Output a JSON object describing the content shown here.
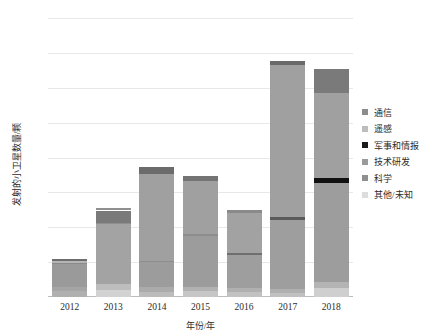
{
  "chart_data": {
    "type": "bar",
    "title": "",
    "subtitle": "",
    "stacked": true,
    "xlabel": "年份/年",
    "ylabel": "发射的小卫星数量/颗",
    "categories": [
      "2012",
      "2013",
      "2014",
      "2015",
      "2016",
      "2017",
      "2018"
    ],
    "ylim": [
      0,
      400
    ],
    "yticks": [
      0,
      50,
      100,
      150,
      200,
      250,
      300,
      350,
      400
    ],
    "ytick_labels": [
      "0",
      "50",
      "100",
      "150",
      "200",
      "250",
      "300",
      "350",
      "400"
    ],
    "grid": true,
    "legend_position": "right",
    "series": [
      {
        "name": "通信",
        "color": "#8c8c8c",
        "values": [
          8,
          6,
          10,
          9,
          5,
          102,
          12
        ]
      },
      {
        "name": "遥感",
        "color": "#bfbfbf",
        "values": [
          10,
          82,
          78,
          72,
          55,
          10,
          148
        ]
      },
      {
        "name": "军事和情报",
        "color": "#1a1a1a",
        "values": [
          2,
          2,
          2,
          2,
          2,
          2,
          6
        ]
      },
      {
        "name": "技术研发",
        "color": "#9a9a9a",
        "values": [
          25,
          28,
          82,
          76,
          56,
          205,
          124
        ]
      },
      {
        "name": "科学",
        "color": "#7d7d7d",
        "values": [
          8,
          7,
          12,
          13,
          5,
          17,
          35
        ]
      },
      {
        "name": "其他/未知",
        "color": "#d9d9d9",
        "values": [
          2,
          2,
          2,
          2,
          2,
          2,
          2
        ]
      }
    ],
    "totals": [
      55,
      127,
      186,
      174,
      125,
      338,
      327
    ],
    "series_colors": [
      "#8c8c8c",
      "#bfbfbf",
      "#1a1a1a",
      "#9a9a9a",
      "#7d7d7d",
      "#d9d9d9"
    ],
    "bar_stacks": [
      {
        "year": "2012",
        "total": 55,
        "segments": [
          {
            "name": "其他/未知",
            "from": 0,
            "to": 8,
            "color": "#b0b0b0"
          },
          {
            "name": "科学",
            "from": 8,
            "to": 14,
            "color": "#a5a5a5"
          },
          {
            "name": "技术研发",
            "from": 14,
            "to": 47,
            "color": "#9a9a9a"
          },
          {
            "name": "军事和情报",
            "from": 47,
            "to": 49,
            "color": "#8a8a8a"
          },
          {
            "name": "遥感",
            "from": 49,
            "to": 51,
            "color": "#b5b5b5"
          },
          {
            "name": "通信",
            "from": 51,
            "to": 55,
            "color": "#6e6e6e"
          }
        ]
      },
      {
        "year": "2013",
        "total": 127,
        "segments": [
          {
            "name": "其他/未知",
            "from": 0,
            "to": 10,
            "color": "#d2d2d2"
          },
          {
            "name": "科学",
            "from": 10,
            "to": 18,
            "color": "#bdbdbd"
          },
          {
            "name": "技术研发",
            "from": 18,
            "to": 104,
            "color": "#a3a3a3"
          },
          {
            "name": "军事和情报",
            "from": 104,
            "to": 106,
            "color": "#8e8e8e"
          },
          {
            "name": "遥感",
            "from": 106,
            "to": 124,
            "color": "#7a7a7a"
          },
          {
            "name": "通信",
            "from": 124,
            "to": 127,
            "color": "#8f8f8f"
          }
        ]
      },
      {
        "year": "2014",
        "total": 186,
        "segments": [
          {
            "name": "其他/未知",
            "from": 0,
            "to": 7,
            "color": "#bcbcbc"
          },
          {
            "name": "科学",
            "from": 7,
            "to": 14,
            "color": "#ababab"
          },
          {
            "name": "技术研发",
            "from": 14,
            "to": 50,
            "color": "#9c9c9c"
          },
          {
            "name": "军事和情报",
            "from": 50,
            "to": 52,
            "color": "#8d8d8d"
          },
          {
            "name": "遥感",
            "from": 52,
            "to": 176,
            "color": "#a0a0a0"
          },
          {
            "name": "通信",
            "from": 176,
            "to": 186,
            "color": "#6b6b6b"
          }
        ]
      },
      {
        "year": "2015",
        "total": 174,
        "segments": [
          {
            "name": "其他/未知",
            "from": 0,
            "to": 8,
            "color": "#c6c6c6"
          },
          {
            "name": "科学",
            "from": 8,
            "to": 15,
            "color": "#b2b2b2"
          },
          {
            "name": "技术研发",
            "from": 15,
            "to": 88,
            "color": "#9c9c9c"
          },
          {
            "name": "军事和情报",
            "from": 88,
            "to": 90,
            "color": "#8d8d8d"
          },
          {
            "name": "遥感",
            "from": 90,
            "to": 166,
            "color": "#a0a0a0"
          },
          {
            "name": "通信",
            "from": 166,
            "to": 174,
            "color": "#747474"
          }
        ]
      },
      {
        "year": "2016",
        "total": 125,
        "segments": [
          {
            "name": "其他/未知",
            "from": 0,
            "to": 7,
            "color": "#c2c2c2"
          },
          {
            "name": "科学",
            "from": 7,
            "to": 13,
            "color": "#b0b0b0"
          },
          {
            "name": "技术研发",
            "from": 13,
            "to": 60,
            "color": "#9e9e9e"
          },
          {
            "name": "军事和情报",
            "from": 60,
            "to": 63,
            "color": "#6f6f6f"
          },
          {
            "name": "遥感",
            "from": 63,
            "to": 120,
            "color": "#a2a2a2"
          },
          {
            "name": "通信",
            "from": 120,
            "to": 125,
            "color": "#8a8a8a"
          }
        ]
      },
      {
        "year": "2017",
        "total": 338,
        "segments": [
          {
            "name": "其他/未知",
            "from": 0,
            "to": 6,
            "color": "#c0c0c0"
          },
          {
            "name": "科学",
            "from": 6,
            "to": 12,
            "color": "#b0b0b0"
          },
          {
            "name": "技术研发",
            "from": 12,
            "to": 110,
            "color": "#9e9e9e"
          },
          {
            "name": "军事和情报",
            "from": 110,
            "to": 114,
            "color": "#5a5a5a"
          },
          {
            "name": "遥感",
            "from": 114,
            "to": 333,
            "color": "#a0a0a0"
          },
          {
            "name": "通信",
            "from": 333,
            "to": 338,
            "color": "#6a6a6a"
          }
        ]
      },
      {
        "year": "2018",
        "total": 327,
        "segments": [
          {
            "name": "其他/未知",
            "from": 0,
            "to": 13,
            "color": "#cfcfcf"
          },
          {
            "name": "科学",
            "from": 13,
            "to": 22,
            "color": "#b4b4b4"
          },
          {
            "name": "技术研发",
            "from": 22,
            "to": 163,
            "color": "#9d9d9d"
          },
          {
            "name": "军事和情报",
            "from": 163,
            "to": 170,
            "color": "#111111"
          },
          {
            "name": "遥感",
            "from": 170,
            "to": 293,
            "color": "#a0a0a0"
          },
          {
            "name": "通信",
            "from": 293,
            "to": 327,
            "color": "#7a7a7a"
          }
        ]
      }
    ],
    "legend": [
      {
        "label": "通信",
        "color": "#8c8c8c"
      },
      {
        "label": "遥感",
        "color": "#bdbdbd"
      },
      {
        "label": "军事和情报",
        "color": "#1a1a1a"
      },
      {
        "label": "技术研发",
        "color": "#9a9a9a"
      },
      {
        "label": "科学",
        "color": "#8f8f8f"
      },
      {
        "label": "其他/未知",
        "color": "#dcdcdc"
      }
    ]
  }
}
